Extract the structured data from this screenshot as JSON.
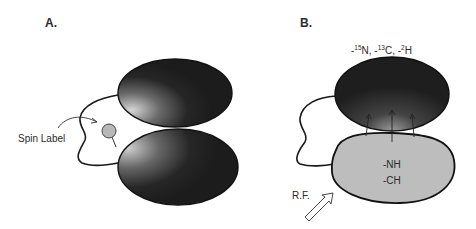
{
  "figure": {
    "panels": [
      {
        "id": "A",
        "label": "A.",
        "annotations": {
          "spin_label": "Spin Label"
        },
        "colors": {
          "domain_dark": "#1e1e1e",
          "domain_highlight": "#c8c8c8",
          "spin_label_fill": "#b8b8b8"
        }
      },
      {
        "id": "B",
        "label": "B.",
        "isotope_label": {
          "parts": [
            {
              "prefix": "-",
              "sup": "15",
              "base": "N"
            },
            {
              "prefix": ", -",
              "sup": "13",
              "base": "C"
            },
            {
              "prefix": ", -",
              "sup": "2",
              "base": "H"
            }
          ]
        },
        "lower_domain_groups": [
          "-NH",
          "-CH"
        ],
        "rf_label": "R.F.",
        "colors": {
          "domain_dark": "#1e1e1e",
          "domain_light": "#bdbdbd"
        }
      }
    ]
  }
}
